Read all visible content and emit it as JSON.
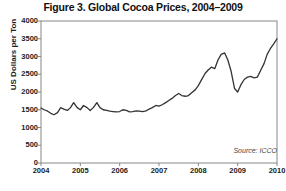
{
  "figure": {
    "title": "Figure 3. Global Cocoa Prices, 2004–2009",
    "source_note": "Source: ICCO",
    "ylabel": "US Dollars per Ton"
  },
  "colors": {
    "line": "#333333",
    "frame": "#888888",
    "text": "#222222",
    "background": "#ffffff"
  },
  "chart_data": {
    "type": "line",
    "title": "Figure 3. Global Cocoa Prices, 2004–2009",
    "xlabel": "",
    "ylabel": "US Dollars per Ton",
    "source": "Source: ICCO",
    "grid": false,
    "legend": null,
    "xlim": [
      2004.0,
      2010.0
    ],
    "ylim": [
      0,
      4000
    ],
    "ytick_labels": [
      "4000",
      "3500",
      "3000",
      "2500",
      "2000",
      "1500",
      "1000",
      "500",
      "0"
    ],
    "ytick_values": [
      4000,
      3500,
      3000,
      2500,
      2000,
      1500,
      1000,
      500,
      0
    ],
    "xtick_labels": [
      "2004",
      "2005",
      "2006",
      "2007",
      "2008",
      "2009",
      "2010"
    ],
    "xtick_values": [
      2004,
      2005,
      2006,
      2007,
      2008,
      2009,
      2010
    ],
    "series": [
      {
        "name": "Global cocoa price",
        "x": [
          2004.0,
          2004.08,
          2004.17,
          2004.25,
          2004.33,
          2004.42,
          2004.5,
          2004.58,
          2004.67,
          2004.75,
          2004.83,
          2004.92,
          2005.0,
          2005.08,
          2005.17,
          2005.25,
          2005.33,
          2005.42,
          2005.5,
          2005.58,
          2005.67,
          2005.75,
          2005.83,
          2005.92,
          2006.0,
          2006.08,
          2006.17,
          2006.25,
          2006.33,
          2006.42,
          2006.5,
          2006.58,
          2006.67,
          2006.75,
          2006.83,
          2006.92,
          2007.0,
          2007.08,
          2007.17,
          2007.25,
          2007.33,
          2007.42,
          2007.5,
          2007.58,
          2007.67,
          2007.75,
          2007.83,
          2007.92,
          2008.0,
          2008.08,
          2008.17,
          2008.25,
          2008.33,
          2008.42,
          2008.5,
          2008.58,
          2008.67,
          2008.75,
          2008.83,
          2008.92,
          2009.0,
          2009.08,
          2009.17,
          2009.25,
          2009.33,
          2009.42,
          2009.5,
          2009.58,
          2009.67,
          2009.75,
          2009.83,
          2009.92,
          2010.0
        ],
        "values": [
          1550,
          1500,
          1460,
          1400,
          1360,
          1420,
          1560,
          1520,
          1480,
          1560,
          1700,
          1560,
          1500,
          1620,
          1560,
          1480,
          1560,
          1700,
          1560,
          1500,
          1480,
          1460,
          1450,
          1440,
          1450,
          1500,
          1480,
          1440,
          1450,
          1470,
          1460,
          1450,
          1470,
          1520,
          1560,
          1620,
          1600,
          1640,
          1700,
          1760,
          1820,
          1900,
          1960,
          1900,
          1880,
          1900,
          1980,
          2060,
          2180,
          2340,
          2520,
          2620,
          2700,
          2660,
          2900,
          3060,
          3100,
          2900,
          2600,
          2100,
          2000,
          2200,
          2360,
          2420,
          2440,
          2400,
          2420,
          2600,
          2800,
          3060,
          3220,
          3360,
          3500
        ]
      }
    ],
    "annotations": [
      {
        "text": "Source: ICCO",
        "position": "bottom-right-inside-plot",
        "style": "italic"
      }
    ]
  }
}
